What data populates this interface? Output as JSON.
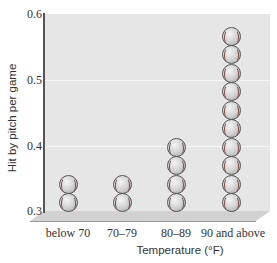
{
  "chart_data": {
    "type": "bar",
    "subtype": "pictograph (stacked baseballs)",
    "title": "",
    "xlabel": "Temperature (°F)",
    "ylabel": "Hit by pitch per game",
    "categories": [
      "below 70",
      "70–79",
      "80–89",
      "90 and above"
    ],
    "values": [
      0.33,
      0.34,
      0.4,
      0.57
    ],
    "ball_counts": [
      2,
      2,
      4,
      10
    ],
    "ylim": [
      0.3,
      0.6
    ],
    "yticks": [
      "0.3",
      "0.4",
      "0.5",
      "0.6"
    ],
    "grid": true,
    "legend": null
  },
  "axis": {
    "y_ticks": [
      {
        "label": "0.6",
        "top": 8
      },
      {
        "label": "0.5",
        "top": 74
      },
      {
        "label": "0.4",
        "top": 140
      },
      {
        "label": "0.3",
        "top": 205
      }
    ],
    "y_title": "Hit by pitch per game",
    "x_title": "Temperature (°F)"
  },
  "columns": [
    {
      "label": "below 70",
      "balls": 2,
      "center": 68
    },
    {
      "label": "70–79",
      "balls": 2,
      "center": 122
    },
    {
      "label": "80–89",
      "balls": 4,
      "center": 176
    },
    {
      "label": "90 and above",
      "balls": 10,
      "center": 231
    }
  ]
}
